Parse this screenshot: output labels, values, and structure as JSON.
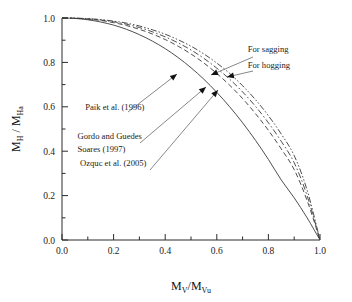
{
  "chart_data": {
    "type": "line",
    "title": "",
    "xlabel": "Mv/Mvu",
    "ylabel": "MH / MHa",
    "xlim": [
      0.0,
      1.0
    ],
    "ylim": [
      0.0,
      1.0
    ],
    "grid": false,
    "legend": "none",
    "x_ticks": [
      "0.0",
      "0.2",
      "0.4",
      "0.6",
      "0.8",
      "1.0"
    ],
    "x_tick_values": [
      0.0,
      0.2,
      0.4,
      0.6,
      0.8,
      1.0
    ],
    "x_minor_ticks": [
      0.1,
      0.3,
      0.5,
      0.7,
      0.9
    ],
    "y_ticks": [
      "0.0",
      "0.2",
      "0.4",
      "0.6",
      "0.8",
      "1.0"
    ],
    "y_tick_values": [
      0.0,
      0.2,
      0.4,
      0.6,
      0.8,
      1.0
    ],
    "y_minor_ticks": [
      0.1,
      0.3,
      0.5,
      0.7,
      0.9
    ],
    "x": [
      0.0,
      0.05,
      0.1,
      0.15,
      0.2,
      0.25,
      0.3,
      0.35,
      0.4,
      0.45,
      0.5,
      0.55,
      0.6,
      0.65,
      0.7,
      0.75,
      0.8,
      0.85,
      0.9,
      0.95,
      1.0
    ],
    "series": [
      {
        "name": "Paik et al. (1996)",
        "style": "solid",
        "color": "#3a3a3a",
        "values": [
          1.0,
          0.998,
          0.992,
          0.982,
          0.968,
          0.949,
          0.925,
          0.896,
          0.862,
          0.822,
          0.776,
          0.724,
          0.665,
          0.6,
          0.528,
          0.449,
          0.363,
          0.27,
          0.19,
          0.1,
          0.0
        ]
      },
      {
        "name": "Gordo and Guedes Soares (1997) - sagging",
        "style": "dashed",
        "color": "#3a3a3a",
        "values": [
          1.0,
          0.999,
          0.995,
          0.989,
          0.979,
          0.966,
          0.949,
          0.928,
          0.903,
          0.873,
          0.838,
          0.797,
          0.75,
          0.697,
          0.637,
          0.569,
          0.494,
          0.41,
          0.317,
          0.178,
          0.0
        ]
      },
      {
        "name": "Gordo and Guedes Soares (1997) - hogging",
        "style": "dashdot",
        "color": "#3a3a3a",
        "values": [
          1.0,
          0.999,
          0.996,
          0.991,
          0.983,
          0.972,
          0.957,
          0.938,
          0.915,
          0.888,
          0.856,
          0.818,
          0.774,
          0.724,
          0.667,
          0.602,
          0.528,
          0.444,
          0.348,
          0.2,
          0.0
        ]
      },
      {
        "name": "Ozquc et al. (2005)",
        "style": "dashdotdot",
        "color": "#3a3a3a",
        "values": [
          1.0,
          0.9995,
          0.997,
          0.993,
          0.986,
          0.977,
          0.964,
          0.947,
          0.927,
          0.902,
          0.873,
          0.838,
          0.797,
          0.75,
          0.695,
          0.632,
          0.56,
          0.477,
          0.38,
          0.225,
          0.0
        ]
      }
    ],
    "annotations": [
      {
        "id": "for-sagging",
        "text": "For sagging",
        "x": 0.72,
        "y": 0.845
      },
      {
        "id": "for-hogging",
        "text": "For hogging",
        "x": 0.72,
        "y": 0.775
      },
      {
        "id": "paik",
        "text": "Paik et al. (1996)",
        "x": 0.09,
        "y": 0.585
      },
      {
        "id": "gordo-1",
        "text": "Gordo and Guedes",
        "x": 0.06,
        "y": 0.455
      },
      {
        "id": "gordo-2",
        "text": "Soares (1997)",
        "x": 0.06,
        "y": 0.395
      },
      {
        "id": "ozquc",
        "text": "Ozquc et al. (2005)",
        "x": 0.07,
        "y": 0.335
      }
    ]
  },
  "axis": {
    "x_label_main": "M",
    "x_label_sub1": "V",
    "x_label_slash": "/M",
    "x_label_sub2": "Vu",
    "y_label_main": "M",
    "y_label_sub1": "H",
    "y_label_slash": " / M",
    "y_label_sub2": "Ha"
  }
}
